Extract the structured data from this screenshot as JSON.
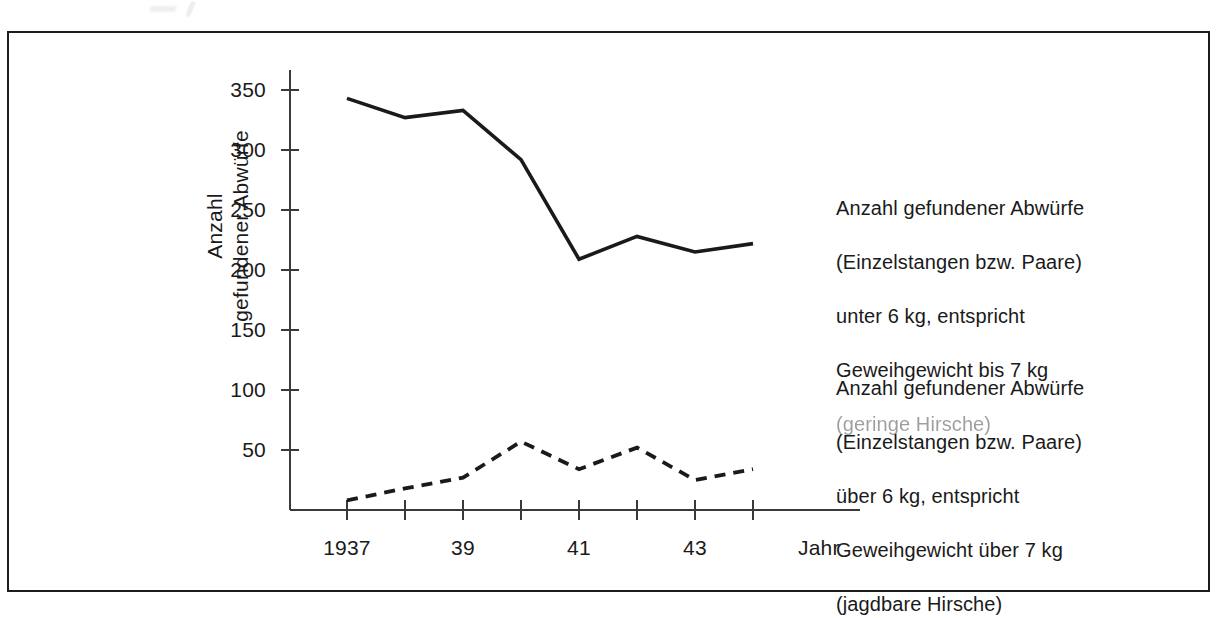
{
  "chart_data": {
    "type": "line",
    "title": "",
    "xlabel": "Jahr",
    "ylabel": "Anzahl\ngefundener Abwürfe",
    "x": [
      1937,
      1938,
      1939,
      1940,
      1941,
      1942,
      1943,
      1944
    ],
    "xtick_values": [
      1937,
      1938,
      1939,
      1940,
      1941,
      1942,
      1943,
      1944
    ],
    "xtick_labels": [
      "1937",
      "",
      "39",
      "",
      "41",
      "",
      "43",
      ""
    ],
    "ytick_labels": [
      "350",
      "300",
      "250",
      "200",
      "150",
      "100",
      "50"
    ],
    "ytick_values": [
      350,
      300,
      250,
      200,
      150,
      100,
      50
    ],
    "ylim": [
      0,
      370
    ],
    "xlim": [
      1936.0,
      1945.6
    ],
    "grid": false,
    "legend_position": "right",
    "series": [
      {
        "name": "Anzahl gefundener Abwürfe (Einzelstangen bzw. Paare) unter 6 kg, entspricht Geweihgewicht bis 7 kg (geringe Hirsche)",
        "style": "solid",
        "color": "#1a1a1a",
        "values": [
          343,
          327,
          333,
          292,
          209,
          228,
          215,
          222
        ]
      },
      {
        "name": "Anzahl gefundener Abwürfe (Einzelstangen bzw. Paare) über 6 kg, entspricht Geweihgewicht über 7 kg (jagdbare Hirsche)",
        "style": "dashed",
        "color": "#1a1a1a",
        "values": [
          8,
          18,
          27,
          57,
          34,
          52,
          25,
          34
        ]
      }
    ]
  },
  "axes": {
    "y_title_line1": "Anzahl",
    "y_title_line2": "gefundener Abwürfe",
    "x_title": "Jahr"
  },
  "legend": {
    "upper": {
      "line1": "Anzahl gefundener Abwürfe",
      "line2": "(Einzelstangen bzw. Paare)",
      "line3": "unter 6 kg, entspricht",
      "line4": "Geweihgewicht bis 7 kg",
      "line5": "(geringe Hirsche)"
    },
    "lower": {
      "line1": "Anzahl gefundener Abwürfe",
      "line2": "(Einzelstangen bzw. Paare)",
      "line3": "über 6 kg, entspricht",
      "line4": "Geweihgewicht über 7 kg",
      "line5": "(jagdbare Hirsche)"
    }
  },
  "style": {
    "ink": "#1a1a1a",
    "axis": "#3a3a3a",
    "frame": "#1c1c1c",
    "background": "#ffffff"
  }
}
